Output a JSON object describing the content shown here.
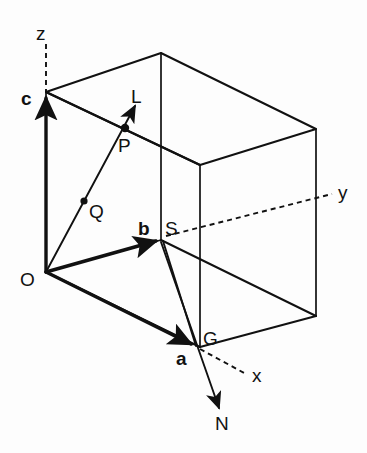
{
  "figure": {
    "type": "line-diagram",
    "background_color": "#fdfdfd",
    "ink_color": "#111111",
    "width": 367,
    "height": 453
  },
  "labels": {
    "axis_z": "z",
    "axis_y": "y",
    "axis_x": "x",
    "origin": "O",
    "vector_a": "a",
    "vector_b": "b",
    "vector_c": "c",
    "point_L": "L",
    "point_P": "P",
    "point_Q": "Q",
    "point_S": "S",
    "point_G": "G",
    "point_N": "N"
  },
  "label_styles": {
    "axis_z": "plain",
    "axis_y": "plain",
    "axis_x": "plain",
    "origin": "plain",
    "vector_a": "bold",
    "vector_b": "bold",
    "vector_c": "bold",
    "point_L": "plain",
    "point_P": "plain",
    "point_Q": "plain",
    "point_S": "plain",
    "point_G": "plain",
    "point_N": "plain"
  },
  "label_positions": {
    "axis_z": {
      "x": 36,
      "y": 40
    },
    "axis_y": {
      "x": 338,
      "y": 199
    },
    "axis_x": {
      "x": 252,
      "y": 382
    },
    "origin": {
      "x": 20,
      "y": 286
    },
    "vector_c": {
      "x": 21,
      "y": 105
    },
    "vector_b": {
      "x": 138,
      "y": 235
    },
    "vector_a": {
      "x": 176,
      "y": 365
    },
    "point_L": {
      "x": 131,
      "y": 103
    },
    "point_P": {
      "x": 118,
      "y": 152
    },
    "point_Q": {
      "x": 89,
      "y": 218
    },
    "point_S": {
      "x": 165,
      "y": 235
    },
    "point_G": {
      "x": 203,
      "y": 345
    },
    "point_N": {
      "x": 215,
      "y": 430
    }
  },
  "geometry": {
    "vertices": {
      "O": {
        "x": 46,
        "y": 272
      },
      "c_top": {
        "x": 46,
        "y": 92
      },
      "top_back": {
        "x": 161,
        "y": 53
      },
      "top_right": {
        "x": 316,
        "y": 129
      },
      "top_front": {
        "x": 200,
        "y": 165
      },
      "S_b": {
        "x": 161,
        "y": 240
      },
      "G_a": {
        "x": 197,
        "y": 347
      },
      "bot_front": {
        "x": 200,
        "y": 347
      },
      "bot_right": {
        "x": 316,
        "y": 316
      },
      "P": {
        "x": 125,
        "y": 128
      },
      "Q": {
        "x": 84,
        "y": 201
      },
      "L_tip": {
        "x": 135,
        "y": 106
      },
      "N_tip": {
        "x": 219,
        "y": 410
      },
      "z_dash_start": {
        "x": 46,
        "y": 44
      },
      "y_dash_end": {
        "x": 332,
        "y": 194
      },
      "x_dash_end": {
        "x": 246,
        "y": 374
      }
    },
    "vectors": [
      {
        "name": "a",
        "from": "O",
        "to": "G_a",
        "style": "thick-arrow"
      },
      {
        "name": "b",
        "from": "O",
        "to": "S_b",
        "style": "thick-arrow"
      },
      {
        "name": "c",
        "from": "O",
        "to": "c_top",
        "style": "thick-arrow"
      }
    ],
    "rays": [
      {
        "name": "normal-OL",
        "from": "O",
        "through": [
          "Q",
          "P"
        ],
        "to": "L_tip",
        "style": "thin-arrow"
      },
      {
        "name": "normal-GN",
        "from": "S_b",
        "through": [
          "G_a"
        ],
        "to": "N_tip",
        "style": "thin-arrow"
      }
    ],
    "dashed_axes": [
      {
        "name": "z",
        "from": "z_dash_start",
        "to": "c_top"
      },
      {
        "name": "y",
        "from": "S_b",
        "to": "y_dash_end"
      },
      {
        "name": "x",
        "from": "G_a",
        "to": "x_dash_end"
      }
    ]
  }
}
